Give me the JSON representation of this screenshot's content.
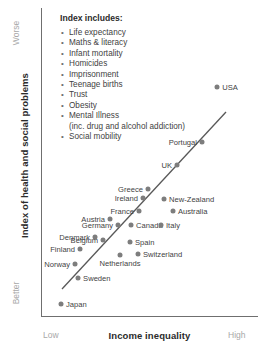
{
  "chart_data": {
    "type": "scatter",
    "title": "",
    "xlabel": "Income inequality",
    "ylabel": "Index of health and social problems",
    "x_low_label": "Low",
    "x_high_label": "High",
    "y_top_label": "Worse",
    "y_bottom_label": "Better",
    "grid": false,
    "legend_position": "top-left-inside",
    "trendline": {
      "label": "linear fit",
      "visible": true
    },
    "points": [
      {
        "label": "USA",
        "x": 0.812,
        "y": 0.742,
        "label_side": "right"
      },
      {
        "label": "Portugal",
        "x": 0.742,
        "y": 0.565,
        "label_side": "left"
      },
      {
        "label": "UK",
        "x": 0.627,
        "y": 0.49,
        "label_side": "left"
      },
      {
        "label": "Greece",
        "x": 0.493,
        "y": 0.412,
        "label_side": "left"
      },
      {
        "label": "New-Zealand",
        "x": 0.567,
        "y": 0.379,
        "label_side": "right"
      },
      {
        "label": "Ireland",
        "x": 0.47,
        "y": 0.383,
        "label_side": "left"
      },
      {
        "label": "Australia",
        "x": 0.608,
        "y": 0.34,
        "label_side": "right"
      },
      {
        "label": "France",
        "x": 0.452,
        "y": 0.342,
        "label_side": "left"
      },
      {
        "label": "Austria",
        "x": 0.318,
        "y": 0.315,
        "label_side": "left"
      },
      {
        "label": "Germany",
        "x": 0.355,
        "y": 0.294,
        "label_side": "left"
      },
      {
        "label": "Canada",
        "x": 0.415,
        "y": 0.294,
        "label_side": "right"
      },
      {
        "label": "Italy",
        "x": 0.553,
        "y": 0.294,
        "label_side": "right"
      },
      {
        "label": "Denmark",
        "x": 0.249,
        "y": 0.258,
        "label_side": "left"
      },
      {
        "label": "Belgium",
        "x": 0.286,
        "y": 0.248,
        "label_side": "left"
      },
      {
        "label": "Spain",
        "x": 0.41,
        "y": 0.239,
        "label_side": "right"
      },
      {
        "label": "Finland",
        "x": 0.18,
        "y": 0.216,
        "label_side": "left"
      },
      {
        "label": "Switzerland",
        "x": 0.447,
        "y": 0.2,
        "label_side": "right"
      },
      {
        "label": "Netherlands",
        "x": 0.364,
        "y": 0.197,
        "label_side": "below"
      },
      {
        "label": "Norway",
        "x": 0.157,
        "y": 0.168,
        "label_side": "left"
      },
      {
        "label": "Sweden",
        "x": 0.171,
        "y": 0.123,
        "label_side": "right"
      },
      {
        "label": "Japan",
        "x": 0.092,
        "y": 0.038,
        "label_side": "right"
      }
    ]
  },
  "legend": {
    "title": "Index includes:",
    "items": [
      {
        "text": "Life expectancy",
        "sub": false
      },
      {
        "text": "Maths & literacy",
        "sub": false
      },
      {
        "text": "Infant mortality",
        "sub": false
      },
      {
        "text": "Homicides",
        "sub": false
      },
      {
        "text": "Imprisonment",
        "sub": false
      },
      {
        "text": "Teenage births",
        "sub": false
      },
      {
        "text": "Trust",
        "sub": false
      },
      {
        "text": "Obesity",
        "sub": false
      },
      {
        "text": "Mental Illness",
        "sub": false
      },
      {
        "text": "(inc. drug and alcohol addiction)",
        "sub": true
      },
      {
        "text": "Social mobility",
        "sub": false
      }
    ]
  },
  "colors": {
    "marker": "#7d7d7d",
    "axis": "#6f6f6f",
    "trendline": "#585858",
    "text": "#3f3f3f",
    "muted_text": "#a8a8a8",
    "background": "#ffffff"
  }
}
